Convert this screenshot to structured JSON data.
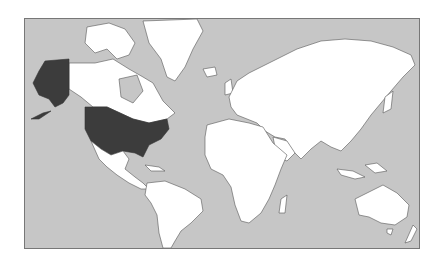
{
  "map": {
    "type": "world-political-mercator",
    "highlighted_regions": [
      "United States",
      "Alaska"
    ],
    "colors": {
      "ocean": "#c6c6c6",
      "land": "#ffffff",
      "highlight": "#3c3c3c",
      "border": "#555555"
    }
  }
}
